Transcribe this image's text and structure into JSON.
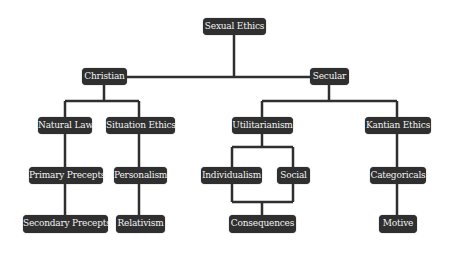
{
  "diagram": {
    "root": "Sexual Ethics",
    "level1": [
      "Christian",
      "Secular"
    ],
    "christian": {
      "children": [
        "Natural Law",
        "Situation Ethics"
      ],
      "natural_law_chain": [
        "Primary Precepts",
        "Secondary Precepts"
      ],
      "situation_ethics_chain": [
        "Personalism",
        "Relativism"
      ]
    },
    "secular": {
      "children": [
        "Utilitarianism",
        "Kantian Ethics"
      ],
      "utilitarianism_branches": [
        "Individualism",
        "Social"
      ],
      "utilitarianism_result": "Consequences",
      "kantian_chain": [
        "Categoricals",
        "Motive"
      ]
    },
    "colors": {
      "node_fill": "#2f2f2f",
      "node_text": "#f2f2f2",
      "connector": "#2f2f2f",
      "background": "#ffffff"
    }
  }
}
